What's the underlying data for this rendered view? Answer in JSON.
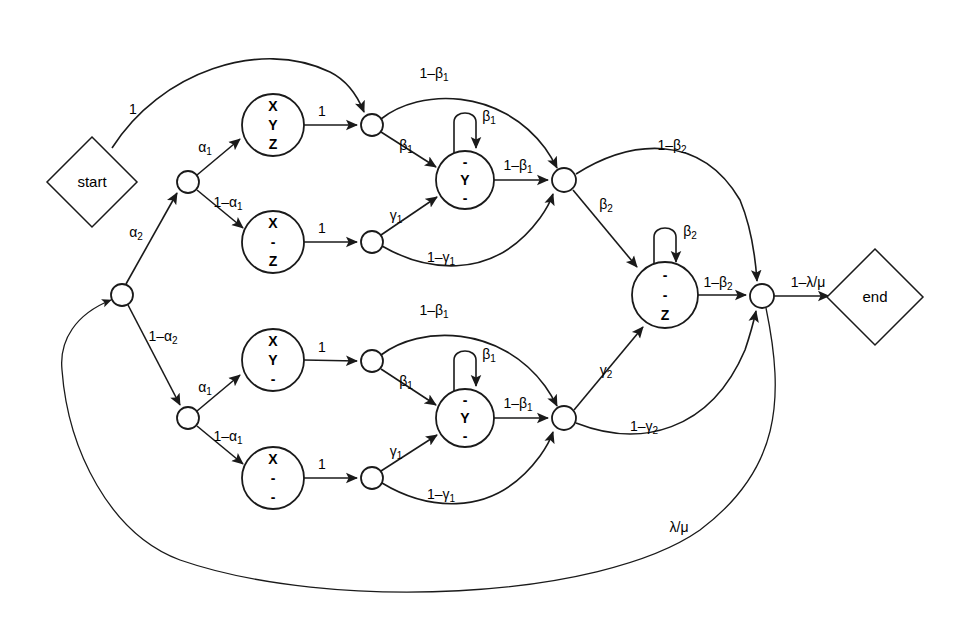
{
  "diagram": {
    "colors": {
      "stroke": "#1a1a1a",
      "fill": "#ffffff",
      "text": "#000000"
    },
    "terminals": [
      {
        "id": "start",
        "label": "start",
        "cx": 92,
        "cy": 182,
        "rx": 45,
        "ry": 45
      },
      {
        "id": "end",
        "label": "end",
        "cx": 875,
        "cy": 297,
        "rx": 48,
        "ry": 48
      }
    ],
    "states": [
      {
        "id": "xyz",
        "lines": [
          "X",
          "Y",
          "Z"
        ],
        "cx": 273,
        "cy": 125,
        "r": 31
      },
      {
        "id": "xdz",
        "lines": [
          "X",
          "-",
          "Z"
        ],
        "cx": 273,
        "cy": 242,
        "r": 31
      },
      {
        "id": "dyd_u",
        "lines": [
          "-",
          "Y",
          "-"
        ],
        "cx": 465,
        "cy": 180,
        "r": 29
      },
      {
        "id": "xyd",
        "lines": [
          "X",
          "Y",
          "-"
        ],
        "cx": 273,
        "cy": 360,
        "r": 31
      },
      {
        "id": "xdd",
        "lines": [
          "X",
          "-",
          "-"
        ],
        "cx": 273,
        "cy": 478,
        "r": 31
      },
      {
        "id": "dyd_l",
        "lines": [
          "-",
          "Y",
          "-"
        ],
        "cx": 465,
        "cy": 418,
        "r": 29
      },
      {
        "id": "ddz",
        "lines": [
          "-",
          "-",
          "Z"
        ],
        "cx": 665,
        "cy": 295,
        "r": 33
      }
    ],
    "junctions": [
      {
        "id": "j-root",
        "cx": 122,
        "cy": 295,
        "r": 11
      },
      {
        "id": "j-upper-br",
        "cx": 188,
        "cy": 182,
        "r": 11
      },
      {
        "id": "j-lower-br",
        "cx": 188,
        "cy": 418,
        "r": 11
      },
      {
        "id": "j-u-beta",
        "cx": 372,
        "cy": 125,
        "r": 11
      },
      {
        "id": "j-u-gamma",
        "cx": 372,
        "cy": 242,
        "r": 11
      },
      {
        "id": "j-u-merge",
        "cx": 564,
        "cy": 180,
        "r": 12
      },
      {
        "id": "j-l-beta",
        "cx": 372,
        "cy": 361,
        "r": 11
      },
      {
        "id": "j-l-gamma",
        "cx": 372,
        "cy": 478,
        "r": 11
      },
      {
        "id": "j-l-merge",
        "cx": 564,
        "cy": 418,
        "r": 12
      },
      {
        "id": "j-final",
        "cx": 762,
        "cy": 296,
        "r": 12
      }
    ],
    "edge_labels": [
      {
        "id": "lbl-start-1",
        "text": "1",
        "sub": "",
        "x": 133,
        "y": 110
      },
      {
        "id": "lbl-alpha2",
        "text": "α",
        "sub": "2",
        "x": 136,
        "y": 233
      },
      {
        "id": "lbl-alpha1-u",
        "text": "α",
        "sub": "1",
        "x": 205,
        "y": 148
      },
      {
        "id": "lbl-1-alpha1-u",
        "text": "1–α",
        "sub": "1",
        "x": 228,
        "y": 203
      },
      {
        "id": "lbl-one-xyz",
        "text": "1",
        "sub": "",
        "x": 322,
        "y": 112
      },
      {
        "id": "lbl-one-xdz",
        "text": "1",
        "sub": "",
        "x": 322,
        "y": 229
      },
      {
        "id": "lbl-1-beta1-u",
        "text": "1–β",
        "sub": "1",
        "x": 434,
        "y": 74
      },
      {
        "id": "lbl-beta1-u",
        "text": "β",
        "sub": "1",
        "x": 406,
        "y": 146
      },
      {
        "id": "lbl-beta1-loop-u",
        "text": "β",
        "sub": "1",
        "x": 487,
        "y": 117
      },
      {
        "id": "lbl-1-beta1-mid-u",
        "text": "1–β",
        "sub": "1",
        "x": 518,
        "y": 166
      },
      {
        "id": "lbl-gamma1-u",
        "text": "γ",
        "sub": "1",
        "x": 396,
        "y": 216
      },
      {
        "id": "lbl-1-gamma1-u",
        "text": "1–γ",
        "sub": "1",
        "x": 441,
        "y": 258
      },
      {
        "id": "lbl-1-beta2",
        "text": "1–β",
        "sub": "2",
        "x": 672,
        "y": 146
      },
      {
        "id": "lbl-beta2",
        "text": "β",
        "sub": "2",
        "x": 606,
        "y": 205
      },
      {
        "id": "lbl-beta2-loop",
        "text": "β",
        "sub": "2",
        "x": 688,
        "y": 232
      },
      {
        "id": "lbl-1-beta2-mid",
        "text": "1–β",
        "sub": "2",
        "x": 718,
        "y": 283
      },
      {
        "id": "lbl-1-lambda-mu",
        "text": "1–λ/μ",
        "sub": "",
        "x": 808,
        "y": 283
      },
      {
        "id": "lbl-1-alpha2",
        "text": "1–α",
        "sub": "2",
        "x": 163,
        "y": 337
      },
      {
        "id": "lbl-alpha1-l",
        "text": "α",
        "sub": "1",
        "x": 205,
        "y": 388
      },
      {
        "id": "lbl-1-alpha1-l",
        "text": "1–α",
        "sub": "1",
        "x": 228,
        "y": 437
      },
      {
        "id": "lbl-one-xyd",
        "text": "1",
        "sub": "",
        "x": 322,
        "y": 348
      },
      {
        "id": "lbl-one-xdd",
        "text": "1",
        "sub": "",
        "x": 322,
        "y": 465
      },
      {
        "id": "lbl-1-beta1-l",
        "text": "1–β",
        "sub": "1",
        "x": 434,
        "y": 311
      },
      {
        "id": "lbl-beta1-l",
        "text": "β",
        "sub": "1",
        "x": 406,
        "y": 382
      },
      {
        "id": "lbl-beta1-loop-l",
        "text": "β",
        "sub": "1",
        "x": 487,
        "y": 355
      },
      {
        "id": "lbl-1-beta1-mid-l",
        "text": "1–β",
        "sub": "1",
        "x": 518,
        "y": 404
      },
      {
        "id": "lbl-gamma1-l",
        "text": "γ",
        "sub": "1",
        "x": 396,
        "y": 452
      },
      {
        "id": "lbl-1-gamma1-l",
        "text": "1–γ",
        "sub": "1",
        "x": 441,
        "y": 495
      },
      {
        "id": "lbl-gamma2",
        "text": "γ",
        "sub": "2",
        "x": 606,
        "y": 371
      },
      {
        "id": "lbl-1-gamma2",
        "text": "1–γ",
        "sub": "2",
        "x": 644,
        "y": 427
      },
      {
        "id": "lbl-lambda-mu",
        "text": "λ/μ",
        "sub": "",
        "x": 679,
        "y": 528
      }
    ]
  }
}
